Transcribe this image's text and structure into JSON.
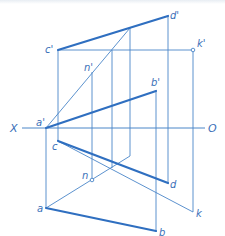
{
  "figure": {
    "type": "descriptive-geometry projection diagram",
    "axis": {
      "left_label": "X",
      "right_label": "O"
    },
    "colors": {
      "line": "#4a86c8",
      "bold_line": "#2f6fc0",
      "label": "#3a6fb8"
    },
    "labels": {
      "a_prime": "a'",
      "b_prime": "b'",
      "c_prime": "c'",
      "d_prime": "d'",
      "k_prime": "k'",
      "n_prime": "n'",
      "a": "a",
      "b": "b",
      "c": "c",
      "d": "d",
      "k": "k",
      "n": "n"
    },
    "points": {
      "a_prime": [
        46,
        128
      ],
      "b_prime": [
        156,
        91
      ],
      "c_prime": [
        58,
        50
      ],
      "d_prime": [
        168,
        16
      ],
      "k_prime": [
        193,
        50
      ],
      "n_prime": [
        92,
        72
      ],
      "a": [
        46,
        208
      ],
      "b": [
        156,
        231
      ],
      "c": [
        58,
        141
      ],
      "d": [
        168,
        183
      ],
      "k": [
        193,
        212
      ],
      "n": [
        92,
        180
      ]
    },
    "bold_segments": [
      "a'b'",
      "c'd'",
      "ab",
      "cd"
    ]
  }
}
